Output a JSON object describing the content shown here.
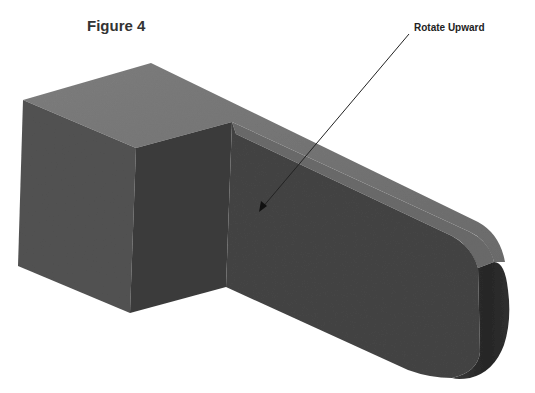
{
  "figure": {
    "title": "Figure 4",
    "annotation": {
      "label": "Rotate Upward",
      "arrow": {
        "from": [
          409,
          34
        ],
        "to": [
          259,
          212
        ]
      }
    },
    "model": {
      "description": "Isometric 3D CAD part: rectangular block with an extended arm ending in a rounded end",
      "colors": {
        "top_face": "#7a7a7a",
        "left_face": "#505050",
        "front_face": "#3e3e3e",
        "arm_face": "#444444",
        "arm_top": "#6f6f6f",
        "rounded_end": "#2e2e2e",
        "background": "#ffffff"
      }
    }
  }
}
